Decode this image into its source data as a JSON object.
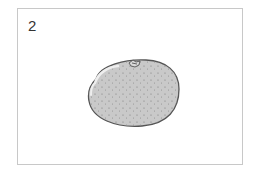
{
  "card": {
    "number": "2"
  },
  "illustration": {
    "subject": "orange-fruit",
    "fill_color": "#c8c8c8",
    "outline_color": "#555555",
    "highlight_color": "#e6e6e6"
  }
}
